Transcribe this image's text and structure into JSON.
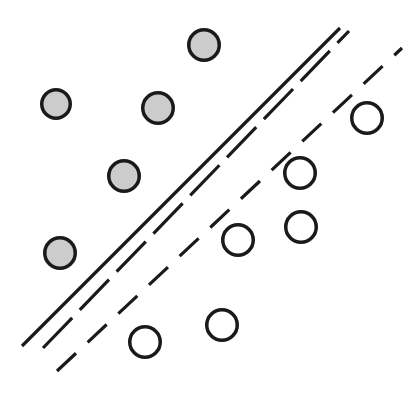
{
  "figure": {
    "name": "svm-margin-diagram",
    "width": 415,
    "height": 395,
    "background": "#ffffff"
  },
  "style": {
    "filled_fill": "#cccccc",
    "filled_stroke": "#1a1a1a",
    "open_fill": "#ffffff",
    "open_stroke": "#1a1a1a",
    "point_stroke_width": 3.5,
    "line_color": "#1a1a1a",
    "line_width": 3.2
  },
  "chart_data": {
    "type": "scatter",
    "title": "",
    "subtitle": "",
    "xlabel": "",
    "ylabel": "",
    "grid": false,
    "legend": "none",
    "axis_visible": false,
    "xlim": [
      0,
      415
    ],
    "ylim": [
      0,
      395
    ],
    "series": [
      {
        "name": "class-filled",
        "marker": "filled-circle",
        "fill": "#cccccc",
        "stroke": "#1a1a1a",
        "radius": 17,
        "points": [
          {
            "label": "f1",
            "x": 204,
            "y": 45,
            "r": 17
          },
          {
            "label": "f2",
            "x": 56,
            "y": 104,
            "r": 16
          },
          {
            "label": "f3",
            "x": 158,
            "y": 108,
            "r": 17
          },
          {
            "label": "f4",
            "x": 124,
            "y": 176,
            "r": 17
          },
          {
            "label": "f5",
            "x": 60,
            "y": 253,
            "r": 17
          }
        ]
      },
      {
        "name": "class-open",
        "marker": "open-circle",
        "fill": "#ffffff",
        "stroke": "#1a1a1a",
        "radius": 17,
        "points": [
          {
            "label": "o1",
            "x": 367,
            "y": 118,
            "r": 17
          },
          {
            "label": "o2",
            "x": 300,
            "y": 173,
            "r": 17
          },
          {
            "label": "o3",
            "x": 301,
            "y": 227,
            "r": 17
          },
          {
            "label": "o4",
            "x": 238,
            "y": 240,
            "r": 17
          },
          {
            "label": "o5",
            "x": 222,
            "y": 325,
            "r": 17
          },
          {
            "label": "o6",
            "x": 145,
            "y": 342,
            "r": 17
          }
        ]
      }
    ],
    "lines": [
      {
        "name": "decision-boundary",
        "style": "solid",
        "dash": "",
        "x1": 22,
        "y1": 346,
        "x2": 340,
        "y2": 28
      },
      {
        "name": "margin-upper",
        "style": "long-dashed",
        "dash": "42 11",
        "x1": 43,
        "y1": 348,
        "x2": 349,
        "y2": 31
      },
      {
        "name": "margin-lower",
        "style": "dashed",
        "dash": "26 16",
        "x1": 57,
        "y1": 371,
        "x2": 402,
        "y2": 48
      }
    ]
  }
}
